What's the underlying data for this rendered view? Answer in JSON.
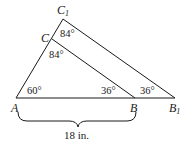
{
  "diagram": {
    "type": "similar-triangles",
    "colors": {
      "line": "#1a1a1a",
      "background": "#ffffff"
    },
    "points": {
      "A": {
        "label": "A",
        "sub": ""
      },
      "B": {
        "label": "B",
        "sub": ""
      },
      "B1": {
        "label": "B",
        "sub": "1"
      },
      "C": {
        "label": "C",
        "sub": ""
      },
      "C1": {
        "label": "C",
        "sub": "1"
      }
    },
    "angles": {
      "A": "60°",
      "C": "84°",
      "C1": "84°",
      "B": "36°",
      "B1": "36°"
    },
    "measurement": {
      "segment": "AB",
      "label": "18 in."
    }
  }
}
